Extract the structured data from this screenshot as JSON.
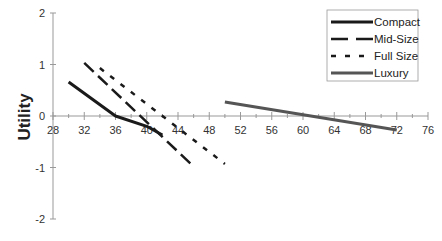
{
  "chart_data": {
    "type": "line",
    "title": "",
    "xlabel": "",
    "ylabel": "Utility",
    "xlim": [
      28,
      76
    ],
    "ylim": [
      -2,
      2
    ],
    "x_ticks": [
      28,
      32,
      36,
      40,
      44,
      48,
      52,
      56,
      60,
      64,
      68,
      72,
      76
    ],
    "y_ticks": [
      2,
      1,
      0,
      -1,
      -2
    ],
    "grid": false,
    "legend_position": "top-right",
    "series": [
      {
        "name": "Compact",
        "style": "solid",
        "color": "#1a1a1a",
        "width": 3,
        "points": [
          [
            30,
            0.66
          ],
          [
            36,
            0.0
          ],
          [
            40,
            -0.2
          ],
          [
            42,
            -0.37
          ]
        ]
      },
      {
        "name": "Mid-Size",
        "style": "long-dash",
        "color": "#1a1a1a",
        "width": 2.5,
        "points": [
          [
            32,
            1.03
          ],
          [
            46,
            -0.98
          ]
        ]
      },
      {
        "name": "Full Size",
        "style": "short-dash",
        "color": "#1a1a1a",
        "width": 2.5,
        "points": [
          [
            34,
            0.93
          ],
          [
            50,
            -0.93
          ]
        ]
      },
      {
        "name": "Luxury",
        "style": "solid",
        "color": "#555555",
        "width": 3,
        "points": [
          [
            50,
            0.27
          ],
          [
            72,
            -0.27
          ]
        ]
      }
    ]
  }
}
